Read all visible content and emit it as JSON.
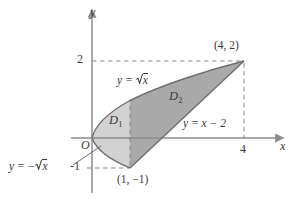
{
  "figure": {
    "kind": "cartesian-region-diagram",
    "axes": {
      "x_axis_label": "x",
      "y_axis_label": "y",
      "origin_label": "O",
      "x_ticks": [
        {
          "value": 4,
          "label": "4"
        }
      ],
      "y_ticks": [
        {
          "value": 2,
          "label": "2"
        },
        {
          "value": -1,
          "label": "-1"
        }
      ],
      "x_range": [
        -0.45,
        4.85
      ],
      "y_range": [
        -1.55,
        2.45
      ],
      "grid": false,
      "dashed_guides": [
        {
          "from": [
            0,
            2
          ],
          "to": [
            4,
            2
          ]
        },
        {
          "from": [
            4,
            2
          ],
          "to": [
            4,
            0
          ]
        },
        {
          "from": [
            0,
            -1
          ],
          "to": [
            1,
            -1
          ]
        },
        {
          "from": [
            1,
            -1
          ],
          "to": [
            1,
            1
          ]
        }
      ]
    },
    "curve_labels": [
      {
        "id": "upper-curve",
        "text_prefix": "y = ",
        "radicand": "x",
        "kind": "sqrt",
        "full": "y = √x"
      },
      {
        "id": "lower-curve",
        "text_prefix": "y = −",
        "radicand": "x",
        "kind": "sqrt",
        "full": "y = −√x"
      },
      {
        "id": "line",
        "full": "y = x − 2"
      }
    ],
    "regions": [
      {
        "name": "D",
        "subscript": "1",
        "fill": "#d2d2d2"
      },
      {
        "name": "D",
        "subscript": "2",
        "fill": "#a9a9a9"
      }
    ],
    "points": [
      {
        "label": "(4, 2)",
        "coords": [
          4,
          2
        ]
      },
      {
        "label": "(1, −1)",
        "coords": [
          1,
          -1
        ]
      }
    ],
    "colors": {
      "region_light": "#d2d2d2",
      "region_dark": "#a9a9a9",
      "outline": "#6e6e6e",
      "axis": "#8c8c8c",
      "dashed": "#8c8c8c",
      "text": "#3a3a3a",
      "background": "#ffffff"
    }
  }
}
